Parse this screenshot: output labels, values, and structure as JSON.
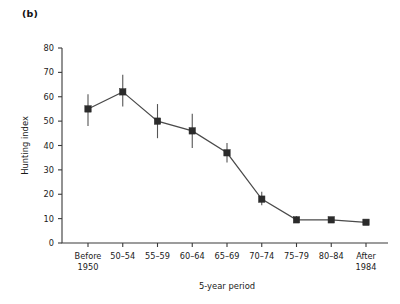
{
  "figure": {
    "panel_label": "(b)",
    "background_color": "#ffffff",
    "ink_color": "#2b2b2b"
  },
  "chart_data": {
    "type": "line",
    "title": "",
    "subtitle": "",
    "xlabel": "5-year period",
    "ylabel": "Hunting index",
    "categories": [
      "Before\n1950",
      "50–54",
      "55–59",
      "60–64",
      "65–69",
      "70–74",
      "75–79",
      "80–84",
      "After\n1984"
    ],
    "category_lines": [
      [
        "Before",
        "1950"
      ],
      [
        "50–54",
        ""
      ],
      [
        "55–59",
        ""
      ],
      [
        "60–64",
        ""
      ],
      [
        "65–69",
        ""
      ],
      [
        "70–74",
        ""
      ],
      [
        "75–79",
        ""
      ],
      [
        "80–84",
        ""
      ],
      [
        "After",
        "1984"
      ]
    ],
    "values": [
      55,
      62,
      50,
      46,
      37,
      18,
      9.5,
      9.5,
      8.5
    ],
    "error_low": [
      48,
      56,
      43,
      39,
      33,
      15.5,
      8.5,
      9.5,
      8.5
    ],
    "error_high": [
      61,
      69,
      57,
      53,
      41,
      21,
      11,
      9.5,
      8.5
    ],
    "ylim": [
      0,
      80
    ],
    "yticks": [
      0,
      10,
      20,
      30,
      40,
      50,
      60,
      70,
      80
    ],
    "ytick_labels": [
      "0",
      "10",
      "20",
      "30",
      "40",
      "50",
      "60",
      "70",
      "80"
    ],
    "grid": false,
    "legend": null,
    "marker": "square",
    "line_color": "#4a4a4a",
    "marker_color": "#2b2b2b"
  }
}
